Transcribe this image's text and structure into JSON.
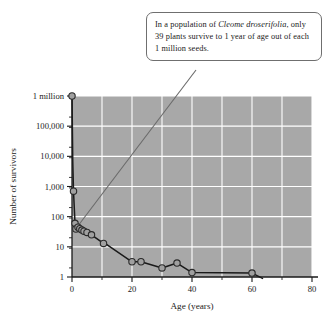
{
  "callout": {
    "line1_pre": "In a population of ",
    "species": "Cleome droserifolia",
    "line1_post": ",",
    "line2": "only 39 plants survive to 1 year of age",
    "line3": "out of each 1 million seeds."
  },
  "chart_data": {
    "type": "line",
    "title": "",
    "xlabel": "Age (years)",
    "ylabel": "Number of survivors",
    "xlim": [
      0,
      80
    ],
    "ylim": [
      1,
      1000000
    ],
    "yscale": "log",
    "grid": true,
    "legend_position": "none",
    "xticks": [
      "0",
      "20",
      "40",
      "60",
      "80"
    ],
    "xtick_values": [
      0,
      20,
      40,
      60,
      80
    ],
    "yticks": [
      "1",
      "10",
      "100",
      "1,000",
      "10,000",
      "100,000",
      "1 million"
    ],
    "ytick_values": [
      1,
      10,
      100,
      1000,
      10000,
      100000,
      1000000
    ],
    "series": [
      {
        "name": "Survivors",
        "x": [
          0,
          0.25,
          0.5,
          1,
          1.3,
          2,
          2.6,
          3.3,
          4,
          5,
          6.5,
          10.5,
          11.5,
          20,
          23,
          30,
          35,
          40,
          60,
          63.5
        ],
        "values": [
          1000000,
          7000,
          700,
          60,
          39,
          45,
          40,
          36,
          33,
          30,
          25,
          13,
          12,
          3.2,
          3.2,
          2,
          2.9,
          1.4,
          1.35,
          0.9
        ]
      }
    ],
    "markers": {
      "x": [
        0,
        0.5,
        1,
        1.3,
        2,
        2.6,
        3.3,
        4,
        5,
        6.5,
        10.5,
        20,
        23,
        30,
        35,
        40,
        60
      ],
      "values": [
        1000000,
        700,
        60,
        39,
        45,
        40,
        36,
        33,
        30,
        25,
        13,
        3.2,
        3.2,
        2,
        2.9,
        1.4,
        1.35
      ]
    },
    "colors": {
      "plot_background": "#a8a8a8",
      "gridline": "#ffffff",
      "line": "#1a1a1a",
      "marker_fill": "#a0a0a0",
      "marker_stroke": "#2a2a2a",
      "leader_line": "#6a6a6a"
    }
  }
}
